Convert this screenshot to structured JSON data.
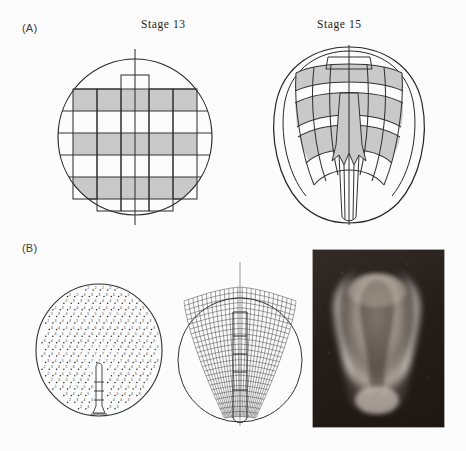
{
  "figure": {
    "background_color": "#fcfcfc",
    "ink_color": "#1a1a1a",
    "shade_color": "#c8c8c8",
    "panels": [
      {
        "id": "A",
        "label": "(A)"
      },
      {
        "id": "B",
        "label": "(B)"
      }
    ]
  },
  "panel_a": {
    "letter": "(A)",
    "left": {
      "title": "Stage 13",
      "diagram_name": "stage-13-fate-map",
      "description": "Circular blastopore-stage view with a rectangular grid of fate-map cells; alternating horizontal rows shaded grey, vertical strips overlaid, bisected by a vertical midline axis.",
      "grid": {
        "columns": 6,
        "rows": 5,
        "shaded_rows": [
          1,
          3,
          5
        ]
      }
    },
    "right": {
      "title": "Stage 15",
      "diagram_name": "stage-15-fate-map",
      "description": "Neurula-stage outline with the same grid deformed into curved arcs converging on the midline; matching cells remain grey, elongated notochord strip runs to the posterior pole.",
      "grid": {
        "columns": 6,
        "rows": 5,
        "shaded_rows": [
          1,
          3,
          5
        ]
      }
    }
  },
  "panel_b": {
    "letter": "(B)",
    "left": {
      "diagram_name": "numbered-fate-map",
      "description": "Circle filled with a fine dot lattice, each dot annotated with a small digit denoting the fate territory; a narrow stalk structure sits on the lower midline.",
      "digit_legend": [
        "2",
        "3",
        "4",
        "5",
        "6",
        "7",
        "8",
        "9"
      ]
    },
    "middle": {
      "diagram_name": "deformed-grid-model",
      "description": "Fine deformed mesh of the same fate map after morphogenetic movement, drawn over the original circle outline; the mesh narrows into an elongated tail.",
      "circle_outline": true
    },
    "right": {
      "image_name": "embryo-photograph",
      "description": "Dark-field photomicrograph of the elongated neurula-stage embryo, light tissue on a dark background."
    }
  }
}
